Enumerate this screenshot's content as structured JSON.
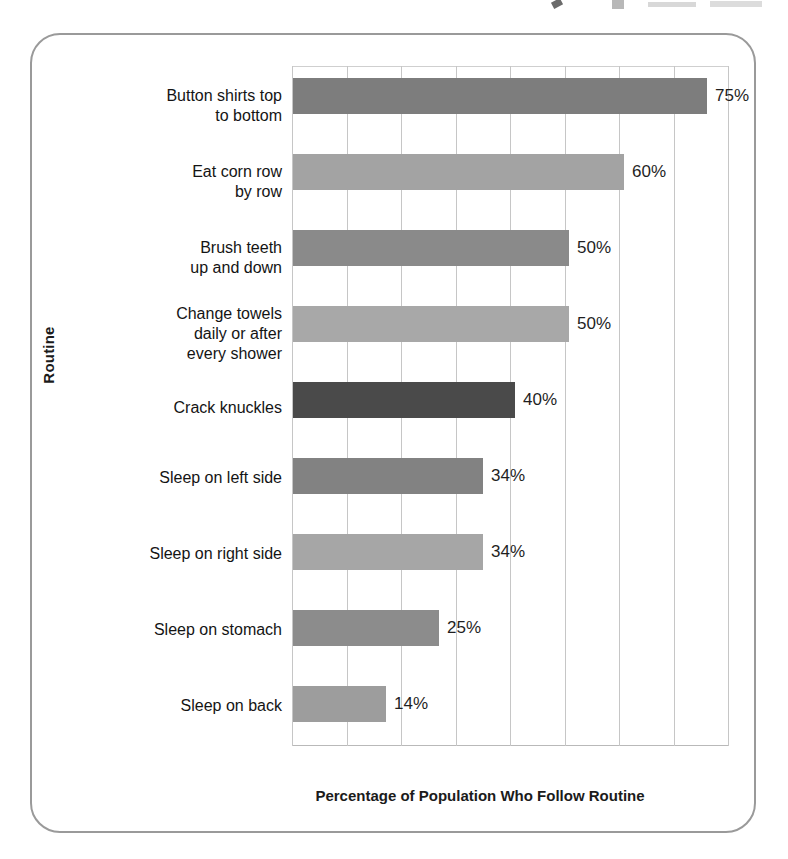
{
  "figure": {
    "x_axis_title": "Percentage of Population Who Follow Routine",
    "y_axis_title": "Routine"
  },
  "chart_data": {
    "type": "bar",
    "orientation": "horizontal",
    "title": "",
    "xlabel": "Percentage of Population Who Follow Routine",
    "ylabel": "Routine",
    "xlim": [
      0,
      80
    ],
    "xtick_step": 10,
    "xtick_labels_shown": false,
    "grid": "vertical",
    "legend": "none",
    "categories": [
      "Button shirts top\nto bottom",
      "Eat corn row\nby row",
      "Brush teeth\nup and down",
      "Change towels\ndaily or after\nevery shower",
      "Crack knuckles",
      "Sleep on left side",
      "Sleep on right side",
      "Sleep on stomach",
      "Sleep on back"
    ],
    "values": [
      75,
      60,
      50,
      50,
      40,
      34,
      34,
      25,
      14
    ],
    "value_labels": [
      "75%",
      "60%",
      "50%",
      "50%",
      "40%",
      "34%",
      "34%",
      "25%",
      "14%"
    ],
    "bar_colors": [
      "#7d7d7d",
      "#a3a3a3",
      "#8a8a8a",
      "#a8a8a8",
      "#4a4a4a",
      "#828282",
      "#a6a6a6",
      "#8c8c8c",
      "#9d9d9d"
    ],
    "bars": [
      {
        "label": "Button shirts top\nto bottom",
        "value": 75,
        "value_label": "75%",
        "color": "#7d7d7d",
        "top": 12,
        "width": 414
      },
      {
        "label": "Eat corn row\nby row",
        "value": 60,
        "value_label": "60%",
        "color": "#a3a3a3",
        "top": 88,
        "width": 331
      },
      {
        "label": "Brush teeth\nup and down",
        "value": 50,
        "value_label": "50%",
        "color": "#8a8a8a",
        "top": 164,
        "width": 276
      },
      {
        "label": "Change towels\ndaily or after\nevery shower",
        "value": 50,
        "value_label": "50%",
        "color": "#a8a8a8",
        "top": 240,
        "width": 276
      },
      {
        "label": "Crack knuckles",
        "value": 40,
        "value_label": "40%",
        "color": "#4a4a4a",
        "top": 316,
        "width": 222
      },
      {
        "label": "Sleep on left side",
        "value": 34,
        "value_label": "34%",
        "color": "#828282",
        "top": 392,
        "width": 190
      },
      {
        "label": "Sleep on right side",
        "value": 34,
        "value_label": "34%",
        "color": "#a6a6a6",
        "top": 468,
        "width": 190
      },
      {
        "label": "Sleep on stomach",
        "value": 25,
        "value_label": "25%",
        "color": "#8c8c8c",
        "top": 544,
        "width": 146
      },
      {
        "label": "Sleep on back",
        "value": 14,
        "value_label": "14%",
        "color": "#9d9d9d",
        "top": 620,
        "width": 93
      }
    ],
    "gridlines_x_px": [
      0,
      54.5,
      109,
      163.5,
      218,
      272.5,
      327,
      381.5,
      436
    ],
    "label_tops": [
      20,
      96,
      172,
      238,
      332,
      402,
      478,
      554,
      630
    ]
  },
  "colors": {
    "card_border": "#9a9a9a",
    "gridline": "#c6c6c6",
    "axis": "#b9b9b9",
    "text": "#141414",
    "highlight_bar": "#4a4a4a"
  }
}
